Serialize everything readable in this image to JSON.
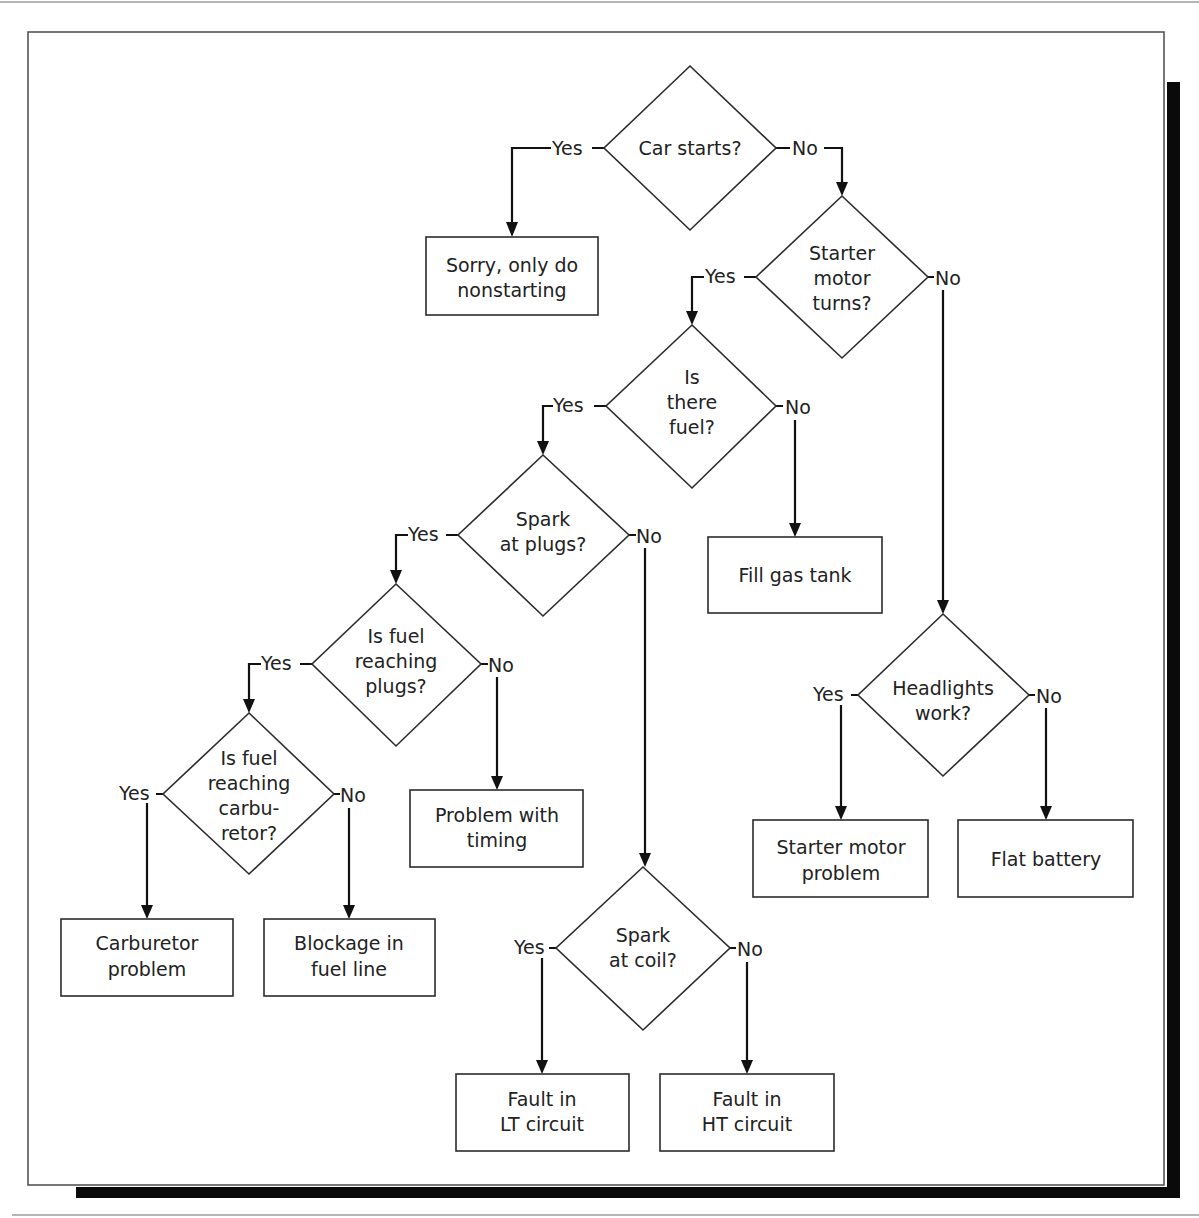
{
  "diagram": {
    "type": "flowchart",
    "branch_labels": {
      "yes": "Yes",
      "no": "No"
    },
    "decisions": [
      {
        "id": "car_starts",
        "lines": [
          "Car starts?"
        ]
      },
      {
        "id": "starter_turns",
        "lines": [
          "Starter",
          "motor",
          "turns?"
        ]
      },
      {
        "id": "is_fuel",
        "lines": [
          "Is",
          "there",
          "fuel?"
        ]
      },
      {
        "id": "spark_plugs",
        "lines": [
          "Spark",
          "at plugs?"
        ]
      },
      {
        "id": "fuel_plugs",
        "lines": [
          "Is fuel",
          "reaching",
          "plugs?"
        ]
      },
      {
        "id": "fuel_carb",
        "lines": [
          "Is fuel",
          "reaching",
          "carbu-",
          "retor?"
        ]
      },
      {
        "id": "headlights",
        "lines": [
          "Headlights",
          "work?"
        ]
      },
      {
        "id": "spark_coil",
        "lines": [
          "Spark",
          "at coil?"
        ]
      }
    ],
    "outcomes": [
      {
        "id": "sorry",
        "lines": [
          "Sorry, only do",
          "nonstarting"
        ]
      },
      {
        "id": "fill_gas",
        "lines": [
          "Fill gas tank"
        ]
      },
      {
        "id": "timing",
        "lines": [
          "Problem with",
          "timing"
        ]
      },
      {
        "id": "starter_problem",
        "lines": [
          "Starter motor",
          "problem"
        ]
      },
      {
        "id": "flat_battery",
        "lines": [
          "Flat battery"
        ]
      },
      {
        "id": "carb_problem",
        "lines": [
          "Carburetor",
          "problem"
        ]
      },
      {
        "id": "blockage",
        "lines": [
          "Blockage in",
          "fuel line"
        ]
      },
      {
        "id": "lt_fault",
        "lines": [
          "Fault in",
          "LT circuit"
        ]
      },
      {
        "id": "ht_fault",
        "lines": [
          "Fault in",
          "HT circuit"
        ]
      }
    ],
    "edges": [
      {
        "from": "car_starts",
        "label": "Yes",
        "to": "sorry"
      },
      {
        "from": "car_starts",
        "label": "No",
        "to": "starter_turns"
      },
      {
        "from": "starter_turns",
        "label": "Yes",
        "to": "is_fuel"
      },
      {
        "from": "starter_turns",
        "label": "No",
        "to": "headlights"
      },
      {
        "from": "is_fuel",
        "label": "Yes",
        "to": "spark_plugs"
      },
      {
        "from": "is_fuel",
        "label": "No",
        "to": "fill_gas"
      },
      {
        "from": "spark_plugs",
        "label": "Yes",
        "to": "fuel_plugs"
      },
      {
        "from": "spark_plugs",
        "label": "No",
        "to": "spark_coil"
      },
      {
        "from": "fuel_plugs",
        "label": "Yes",
        "to": "fuel_carb"
      },
      {
        "from": "fuel_plugs",
        "label": "No",
        "to": "timing"
      },
      {
        "from": "fuel_carb",
        "label": "Yes",
        "to": "carb_problem"
      },
      {
        "from": "fuel_carb",
        "label": "No",
        "to": "blockage"
      },
      {
        "from": "headlights",
        "label": "Yes",
        "to": "starter_problem"
      },
      {
        "from": "headlights",
        "label": "No",
        "to": "flat_battery"
      },
      {
        "from": "spark_coil",
        "label": "Yes",
        "to": "lt_fault"
      },
      {
        "from": "spark_coil",
        "label": "No",
        "to": "ht_fault"
      }
    ]
  },
  "labels": {
    "yes": "Yes",
    "no": "No"
  },
  "nodes": {
    "car_starts": {
      "l1": "Car starts?"
    },
    "starter_turns": {
      "l1": "Starter",
      "l2": "motor",
      "l3": "turns?"
    },
    "is_fuel": {
      "l1": "Is",
      "l2": "there",
      "l3": "fuel?"
    },
    "spark_plugs": {
      "l1": "Spark",
      "l2": "at plugs?"
    },
    "fuel_plugs": {
      "l1": "Is fuel",
      "l2": "reaching",
      "l3": "plugs?"
    },
    "fuel_carb": {
      "l1": "Is fuel",
      "l2": "reaching",
      "l3": "carbu-",
      "l4": "retor?"
    },
    "headlights": {
      "l1": "Headlights",
      "l2": "work?"
    },
    "spark_coil": {
      "l1": "Spark",
      "l2": "at coil?"
    },
    "sorry": {
      "l1": "Sorry, only do",
      "l2": "nonstarting"
    },
    "fill_gas": {
      "l1": "Fill gas tank"
    },
    "timing": {
      "l1": "Problem with",
      "l2": "timing"
    },
    "starter_problem": {
      "l1": "Starter motor",
      "l2": "problem"
    },
    "flat_battery": {
      "l1": "Flat battery"
    },
    "carb_problem": {
      "l1": "Carburetor",
      "l2": "problem"
    },
    "blockage": {
      "l1": "Blockage in",
      "l2": "fuel line"
    },
    "lt_fault": {
      "l1": "Fault in",
      "l2": "LT circuit"
    },
    "ht_fault": {
      "l1": "Fault in",
      "l2": "HT circuit"
    }
  }
}
